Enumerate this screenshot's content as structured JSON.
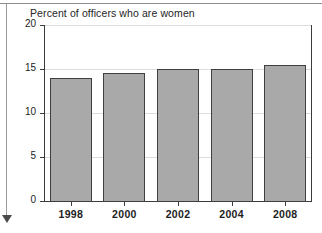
{
  "chart_data": {
    "type": "bar",
    "title": "Percent of officers who are women",
    "xlabel": "",
    "ylabel": "",
    "categories": [
      "1998",
      "2000",
      "2002",
      "2004",
      "2008"
    ],
    "values": [
      14.0,
      14.6,
      15.0,
      15.0,
      15.4
    ],
    "ylim": [
      0,
      20
    ],
    "yticks": [
      "0",
      "5",
      "10",
      "15",
      "20"
    ],
    "ytick_values": [
      0,
      5,
      10,
      15,
      20
    ],
    "grid": true,
    "legend": "none",
    "bar_color": "#a9a9a9",
    "bar_border_color": "#3f3f3f",
    "axis_color": "#3c3c3c",
    "gridline_color": "#dcdcdc"
  },
  "decorations": {
    "top_rule": "horizontal-rule",
    "left_margin_rule": "vertical-rule-with-down-arrow",
    "arrow_direction": "down"
  }
}
